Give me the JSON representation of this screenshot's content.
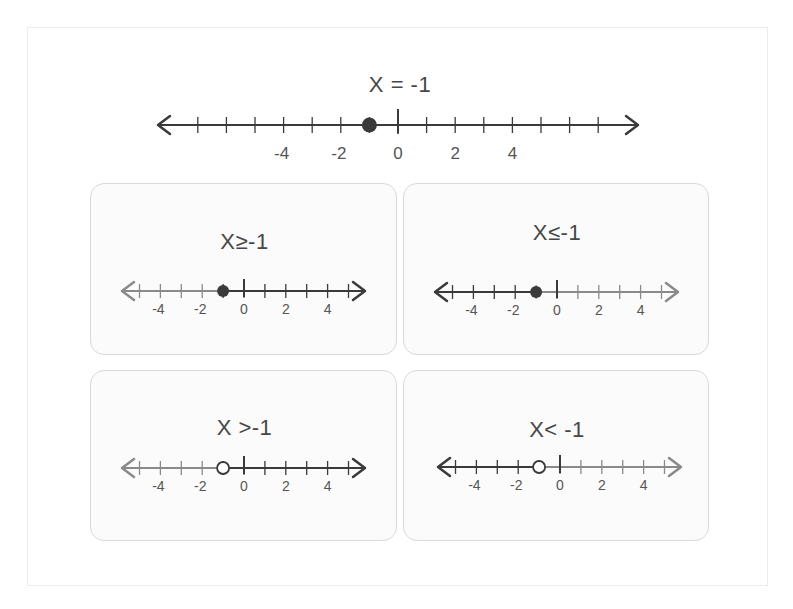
{
  "main": {
    "title": "X = -1",
    "point": -1,
    "point_type": "closed",
    "axis": {
      "min": -7,
      "max": 7,
      "labels": [
        "-4",
        "-2",
        "0",
        "2",
        "4"
      ]
    }
  },
  "cards": [
    {
      "title": "X≥-1",
      "point": -1,
      "point_type": "closed",
      "shade": "right"
    },
    {
      "title": "X≤-1",
      "point": -1,
      "point_type": "closed",
      "shade": "left"
    },
    {
      "title": "X >-1",
      "point": -1,
      "point_type": "open",
      "shade": "right"
    },
    {
      "title": "X< -1",
      "point": -1,
      "point_type": "open",
      "shade": "left"
    }
  ],
  "card_axis": {
    "min": -5,
    "max": 5,
    "labels": [
      "-4",
      "-2",
      "0",
      "2",
      "4"
    ]
  },
  "colors": {
    "dark": "#3a3a3a",
    "light": "#8a8a8a",
    "border": "#d9d9d9",
    "card_bg": "#fbfbfb"
  }
}
